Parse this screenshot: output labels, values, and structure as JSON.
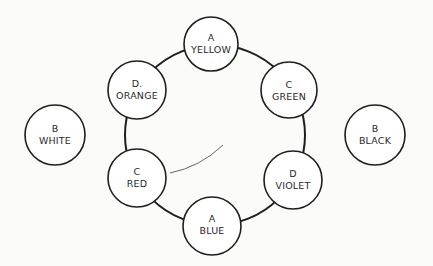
{
  "diagram": {
    "type": "color-wheel",
    "ring": {
      "cx": 215,
      "cy": 135,
      "r": 90,
      "color": "#1e1e1e"
    },
    "inner_arc": {
      "from": [
        170,
        173
      ],
      "to": [
        223,
        145
      ]
    },
    "nodes": [
      {
        "id": "yellow",
        "letter": "A",
        "label": "YELLOW",
        "cx": 211,
        "cy": 44,
        "r": 27,
        "on_ring": true
      },
      {
        "id": "green",
        "letter": "C",
        "label": "GREEN",
        "cx": 289,
        "cy": 90,
        "r": 28,
        "on_ring": true
      },
      {
        "id": "violet",
        "letter": "D",
        "label": "VIOLET",
        "cx": 293,
        "cy": 180,
        "r": 29,
        "on_ring": true
      },
      {
        "id": "blue",
        "letter": "A",
        "label": "BLUE",
        "cx": 212,
        "cy": 226,
        "r": 29,
        "on_ring": true
      },
      {
        "id": "red",
        "letter": "C",
        "label": "RED",
        "cx": 137,
        "cy": 178,
        "r": 29,
        "on_ring": true
      },
      {
        "id": "orange",
        "letter": "D.",
        "label": "ORANGE",
        "cx": 137,
        "cy": 90,
        "r": 29,
        "on_ring": true
      },
      {
        "id": "white",
        "letter": "B",
        "label": "WHITE",
        "cx": 55,
        "cy": 135,
        "r": 30,
        "on_ring": false
      },
      {
        "id": "black",
        "letter": "B",
        "label": "BLACK",
        "cx": 375,
        "cy": 135,
        "r": 30,
        "on_ring": false
      }
    ]
  }
}
